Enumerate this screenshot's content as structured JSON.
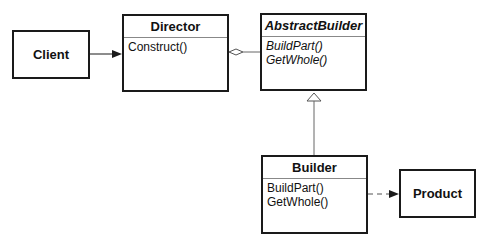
{
  "diagram": {
    "nodes": {
      "client": {
        "label": "Client"
      },
      "director": {
        "name": "Director",
        "operations": [
          "Construct()"
        ]
      },
      "abstract_builder": {
        "name": "AbstractBuilder",
        "abstract": true,
        "operations": [
          "BuildPart()",
          "GetWhole()"
        ]
      },
      "builder": {
        "name": "Builder",
        "operations": [
          "BuildPart()",
          "GetWhole()"
        ]
      },
      "product": {
        "label": "Product"
      }
    },
    "edges": [
      {
        "from": "Client",
        "to": "Director",
        "type": "association"
      },
      {
        "from": "Director",
        "to": "AbstractBuilder",
        "type": "aggregation"
      },
      {
        "from": "Builder",
        "to": "AbstractBuilder",
        "type": "generalization"
      },
      {
        "from": "Builder",
        "to": "Product",
        "type": "dependency"
      }
    ],
    "colors": {
      "line": "#1a1a1a",
      "divider": "#888888",
      "background": "#ffffff"
    }
  }
}
